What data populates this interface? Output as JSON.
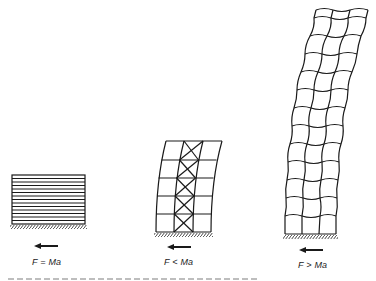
{
  "diagram": {
    "type": "structural-response-comparison",
    "panels": [
      {
        "id": "rigid",
        "label": "F = Ma",
        "structure": "rigid block (horizontal hatching)",
        "rows": 14,
        "force_arrow": "left"
      },
      {
        "id": "braced-frame",
        "label": "F < Ma",
        "structure": "frame with braced core",
        "rows": 5,
        "columns": 3,
        "braced_column": 2,
        "force_arrow": "left"
      },
      {
        "id": "flexible-tower",
        "label": "F > Ma",
        "structure": "tall flexible frame",
        "rows": 12,
        "columns": 3,
        "force_arrow": "left"
      }
    ],
    "caption_visible": "truncated"
  },
  "colors": {
    "ink": "#1a1a1a",
    "background": "#ffffff"
  }
}
